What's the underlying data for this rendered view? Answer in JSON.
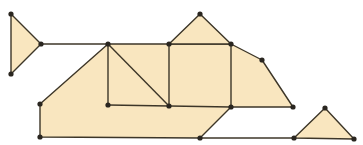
{
  "colors": {
    "background": "#ffffff",
    "fill": "#f9e6bf",
    "stroke": "#3d3628",
    "vertex": "#2a2620"
  },
  "shapes": [
    {
      "name": "left-triangle",
      "points": [
        [
          11,
          14
        ],
        [
          41,
          44
        ],
        [
          11,
          74
        ]
      ]
    },
    {
      "name": "main-body",
      "points": [
        [
          108,
          44
        ],
        [
          231,
          44
        ],
        [
          262,
          60
        ],
        [
          293,
          107
        ],
        [
          231,
          107
        ],
        [
          200,
          138
        ],
        [
          40,
          137
        ],
        [
          40,
          104
        ]
      ]
    },
    {
      "name": "top-triangle",
      "points": [
        [
          169,
          44
        ],
        [
          200,
          14
        ],
        [
          231,
          44
        ]
      ]
    },
    {
      "name": "right-triangle",
      "points": [
        [
          294,
          138
        ],
        [
          325,
          108
        ],
        [
          354,
          139
        ]
      ]
    }
  ],
  "lines": [
    [
      [
        41,
        44
      ],
      [
        108,
        44
      ]
    ],
    [
      [
        108,
        44
      ],
      [
        108,
        105
      ]
    ],
    [
      [
        108,
        105
      ],
      [
        231,
        107
      ]
    ],
    [
      [
        108,
        44
      ],
      [
        169,
        106
      ]
    ],
    [
      [
        169,
        44
      ],
      [
        169,
        106
      ]
    ],
    [
      [
        231,
        44
      ],
      [
        231,
        107
      ]
    ],
    [
      [
        200,
        138
      ],
      [
        294,
        138
      ]
    ]
  ],
  "vertices": [
    [
      11,
      14
    ],
    [
      41,
      44
    ],
    [
      11,
      74
    ],
    [
      108,
      44
    ],
    [
      169,
      44
    ],
    [
      200,
      14
    ],
    [
      231,
      44
    ],
    [
      262,
      60
    ],
    [
      293,
      107
    ],
    [
      231,
      107
    ],
    [
      169,
      106
    ],
    [
      108,
      105
    ],
    [
      40,
      104
    ],
    [
      40,
      137
    ],
    [
      200,
      138
    ],
    [
      294,
      138
    ],
    [
      325,
      108
    ],
    [
      354,
      139
    ]
  ]
}
